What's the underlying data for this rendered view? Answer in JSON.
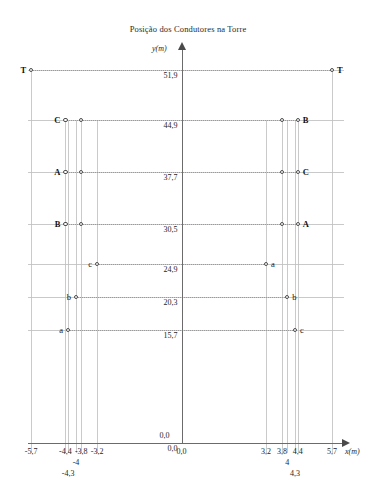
{
  "chart_data": {
    "type": "scatter",
    "title": "Posição dos Condutores na Torre",
    "xlabel": "x(m)",
    "ylabel": "y(m)",
    "xlim": [
      -6.2,
      6.2
    ],
    "ylim": [
      0.0,
      54.0
    ],
    "grid": true,
    "legend": "none",
    "x_ticks": [
      {
        "value": -5.7,
        "label": "-5,7",
        "row": 0
      },
      {
        "value": -4.4,
        "label": "-4,4",
        "row": 0
      },
      {
        "value": -4.3,
        "label": "-4,3",
        "row": 2
      },
      {
        "value": -4.0,
        "label": "-4",
        "row": 1
      },
      {
        "value": -3.8,
        "label": "-3,8",
        "row": 0
      },
      {
        "value": -3.2,
        "label": "-3,2",
        "row": 0
      },
      {
        "value": 0.0,
        "label": "0,0",
        "row": 0
      },
      {
        "value": 3.2,
        "label": "3,2",
        "row": 0
      },
      {
        "value": 3.8,
        "label": "3,8",
        "row": 0
      },
      {
        "value": 4.0,
        "label": "4",
        "row": 1
      },
      {
        "value": 4.3,
        "label": "4,3",
        "row": 2
      },
      {
        "value": 4.4,
        "label": "4,4",
        "row": 0
      },
      {
        "value": 5.7,
        "label": "5,7",
        "row": 0
      }
    ],
    "y_ticks": [
      {
        "value": 51.9,
        "label": "51,9"
      },
      {
        "value": 44.9,
        "label": "44,9"
      },
      {
        "value": 37.7,
        "label": "37,7"
      },
      {
        "value": 30.5,
        "label": "30,5"
      },
      {
        "value": 24.9,
        "label": "24,9"
      },
      {
        "value": 20.3,
        "label": "20,3"
      },
      {
        "value": 15.7,
        "label": "15,7"
      },
      {
        "value": 0.0,
        "label": "0,0"
      }
    ],
    "origin_label": "0,0",
    "points": [
      {
        "name": "T-left",
        "label": "T",
        "x": -5.7,
        "y": 51.9,
        "side": "left",
        "bold": true
      },
      {
        "name": "T-right",
        "label": "T",
        "x": 5.7,
        "y": 51.9,
        "side": "right",
        "bold": true
      },
      {
        "name": "C-left-outer",
        "label": "C",
        "x": -4.4,
        "y": 44.9,
        "side": "left",
        "bold": true
      },
      {
        "name": "C-left-inner",
        "label": "",
        "x": -3.8,
        "y": 44.9,
        "side": "none",
        "bold": false
      },
      {
        "name": "B-right-inner",
        "label": "",
        "x": 3.8,
        "y": 44.9,
        "side": "none",
        "bold": false
      },
      {
        "name": "B-right-outer",
        "label": "B",
        "x": 4.4,
        "y": 44.9,
        "side": "right",
        "bold": true
      },
      {
        "name": "A-left-outer",
        "label": "A",
        "x": -4.4,
        "y": 37.7,
        "side": "left",
        "bold": true
      },
      {
        "name": "A-left-inner",
        "label": "",
        "x": -3.8,
        "y": 37.7,
        "side": "none",
        "bold": false
      },
      {
        "name": "C-right-inner",
        "label": "",
        "x": 3.8,
        "y": 37.7,
        "side": "none",
        "bold": false
      },
      {
        "name": "C-right-outer",
        "label": "C",
        "x": 4.4,
        "y": 37.7,
        "side": "right",
        "bold": true
      },
      {
        "name": "B-left-outer",
        "label": "B",
        "x": -4.4,
        "y": 30.5,
        "side": "left",
        "bold": true
      },
      {
        "name": "B-left-inner",
        "label": "",
        "x": -3.8,
        "y": 30.5,
        "side": "none",
        "bold": false
      },
      {
        "name": "A-right-inner",
        "label": "",
        "x": 3.8,
        "y": 30.5,
        "side": "none",
        "bold": false
      },
      {
        "name": "A-right-outer",
        "label": "A",
        "x": 4.4,
        "y": 30.5,
        "side": "right",
        "bold": true
      },
      {
        "name": "c-left",
        "label": "c",
        "x": -3.2,
        "y": 24.9,
        "side": "left",
        "bold": false
      },
      {
        "name": "a-right",
        "label": "a",
        "x": 3.2,
        "y": 24.9,
        "side": "right",
        "bold": false
      },
      {
        "name": "b-left",
        "label": "b",
        "x": -4.0,
        "y": 20.3,
        "side": "left",
        "bold": false
      },
      {
        "name": "b-right",
        "label": "b",
        "x": 4.0,
        "y": 20.3,
        "side": "right",
        "bold": false
      },
      {
        "name": "a-left",
        "label": "a",
        "x": -4.3,
        "y": 15.7,
        "side": "left",
        "bold": false
      },
      {
        "name": "c-right",
        "label": "c",
        "x": 4.3,
        "y": 15.7,
        "side": "right",
        "bold": false
      }
    ],
    "connectors": [
      {
        "y": 51.9,
        "x1": -5.7,
        "x2": 5.7
      },
      {
        "y": 44.9,
        "x1": -4.4,
        "x2": 4.4
      },
      {
        "y": 37.7,
        "x1": -4.4,
        "x2": 4.4
      },
      {
        "y": 30.5,
        "x1": -4.4,
        "x2": 4.4
      },
      {
        "y": 24.9,
        "x1": -3.2,
        "x2": 3.2
      },
      {
        "y": 20.3,
        "x1": -4.0,
        "x2": 4.0
      },
      {
        "y": 15.7,
        "x1": -4.3,
        "x2": 4.3
      }
    ],
    "vertical_droplines": [
      -5.7,
      -4.4,
      -4.3,
      -4.0,
      -3.8,
      -3.2,
      3.2,
      3.8,
      4.0,
      4.3,
      4.4,
      5.7
    ]
  }
}
